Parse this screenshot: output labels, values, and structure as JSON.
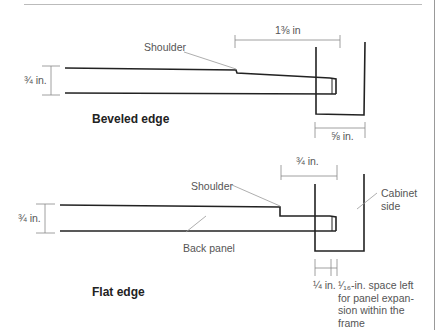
{
  "diagram": {
    "type": "technical-drawing",
    "colors": {
      "line": "#222222",
      "dimension": "#777777",
      "label": "#555555",
      "rule": "#bbbbbb"
    }
  },
  "beveled": {
    "title": "Beveled edge",
    "shoulder_label": "Shoulder",
    "thickness_dim": "¾ in.",
    "length_dim": "1⅜ in",
    "groove_dim": "⅝ in."
  },
  "flat": {
    "title": "Flat edge",
    "shoulder_label": "Shoulder",
    "thickness_dim": "¾ in.",
    "top_dim": "¾ in.",
    "back_panel_label": "Back panel",
    "cabinet_side_label_1": "Cabinet",
    "cabinet_side_label_2": "side",
    "gap_dim": "¼ in.",
    "space_note_1": "¹⁄₁₆-in. space left",
    "space_note_2": "for panel expan-",
    "space_note_3": "sion within the",
    "space_note_4": "frame"
  }
}
